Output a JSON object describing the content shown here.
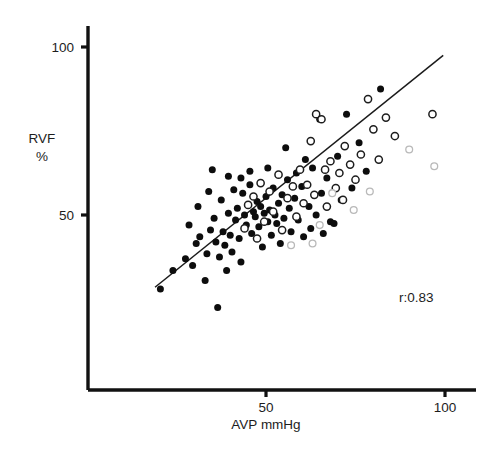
{
  "chart_data": {
    "type": "scatter",
    "title": "",
    "xlabel": "AVP mmHg",
    "ylabel_line1": "RVF",
    "ylabel_line2": "%",
    "xticks": [
      50,
      100
    ],
    "xticklabels": [
      "50",
      "100"
    ],
    "yticks": [
      50,
      100
    ],
    "yticklabels": [
      "50",
      "100"
    ],
    "xlim": [
      0,
      115
    ],
    "ylim": [
      0,
      113
    ],
    "grid": false,
    "legend": "none",
    "annotations": [
      {
        "text": "r:0.83",
        "x": 92,
        "y": 24
      }
    ],
    "trendline": {
      "label": "regression line",
      "x_start": 19,
      "y_start": 28.5,
      "x_end": 99.5,
      "y_end": 97.5
    },
    "series": [
      {
        "name": "filled circles",
        "marker": "filled-circle",
        "points": [
          [
            20.5,
            28.0
          ],
          [
            24.0,
            33.5
          ],
          [
            27.5,
            37.0
          ],
          [
            29.5,
            35.0
          ],
          [
            30.5,
            41.5
          ],
          [
            31.5,
            43.5
          ],
          [
            33.0,
            30.5
          ],
          [
            33.5,
            38.5
          ],
          [
            34.5,
            45.5
          ],
          [
            35.0,
            63.5
          ],
          [
            35.5,
            49.0
          ],
          [
            36.0,
            42.0
          ],
          [
            36.5,
            22.5
          ],
          [
            37.0,
            37.5
          ],
          [
            37.5,
            54.5
          ],
          [
            38.0,
            45.0
          ],
          [
            38.5,
            41.0
          ],
          [
            39.0,
            33.5
          ],
          [
            39.5,
            50.5
          ],
          [
            40.0,
            44.0
          ],
          [
            40.5,
            39.0
          ],
          [
            41.0,
            57.5
          ],
          [
            41.5,
            48.5
          ],
          [
            42.0,
            52.0
          ],
          [
            42.5,
            43.0
          ],
          [
            43.0,
            36.0
          ],
          [
            43.5,
            56.5
          ],
          [
            44.0,
            50.0
          ],
          [
            44.5,
            47.0
          ],
          [
            45.0,
            53.0
          ],
          [
            45.5,
            59.0
          ],
          [
            46.0,
            44.5
          ],
          [
            46.5,
            51.0
          ],
          [
            47.0,
            49.5
          ],
          [
            47.5,
            54.0
          ],
          [
            48.0,
            46.5
          ],
          [
            48.5,
            52.5
          ],
          [
            49.0,
            40.5
          ],
          [
            49.5,
            50.5
          ],
          [
            50.0,
            55.5
          ],
          [
            50.5,
            48.0
          ],
          [
            51.0,
            51.5
          ],
          [
            51.5,
            44.0
          ],
          [
            52.0,
            58.0
          ],
          [
            52.5,
            50.0
          ],
          [
            53.0,
            47.5
          ],
          [
            53.5,
            53.5
          ],
          [
            54.0,
            41.5
          ],
          [
            54.5,
            56.0
          ],
          [
            55.0,
            49.0
          ],
          [
            56.0,
            60.5
          ],
          [
            56.5,
            52.0
          ],
          [
            57.0,
            45.0
          ],
          [
            58.0,
            55.0
          ],
          [
            58.5,
            62.5
          ],
          [
            59.0,
            48.5
          ],
          [
            60.0,
            58.5
          ],
          [
            60.5,
            43.5
          ],
          [
            61.0,
            66.5
          ],
          [
            62.0,
            52.5
          ],
          [
            62.5,
            46.0
          ],
          [
            63.0,
            64.0
          ],
          [
            64.0,
            50.0
          ],
          [
            65.0,
            78.5
          ],
          [
            65.5,
            56.5
          ],
          [
            66.0,
            44.5
          ],
          [
            67.0,
            61.0
          ],
          [
            68.0,
            48.0
          ],
          [
            69.0,
            47.5
          ],
          [
            70.0,
            67.5
          ],
          [
            71.0,
            54.5
          ],
          [
            72.5,
            80.0
          ],
          [
            74.0,
            58.0
          ],
          [
            76.0,
            71.5
          ],
          [
            78.0,
            63.0
          ],
          [
            82.0,
            87.5
          ],
          [
            28.5,
            47.0
          ],
          [
            31.0,
            52.5
          ],
          [
            34.0,
            57.0
          ],
          [
            39.5,
            61.5
          ],
          [
            43.0,
            61.0
          ],
          [
            45.5,
            63.0
          ],
          [
            50.5,
            64.0
          ],
          [
            55.5,
            70.0
          ]
        ]
      },
      {
        "name": "open circles",
        "marker": "open-circle",
        "points": [
          [
            44.0,
            46.0
          ],
          [
            45.0,
            53.0
          ],
          [
            46.5,
            55.5
          ],
          [
            47.5,
            43.0
          ],
          [
            48.5,
            59.5
          ],
          [
            49.5,
            48.0
          ],
          [
            51.0,
            57.0
          ],
          [
            52.0,
            51.0
          ],
          [
            53.5,
            62.0
          ],
          [
            54.5,
            45.5
          ],
          [
            56.0,
            55.0
          ],
          [
            57.5,
            58.5
          ],
          [
            58.5,
            49.5
          ],
          [
            59.5,
            63.5
          ],
          [
            60.5,
            53.5
          ],
          [
            61.5,
            59.0
          ],
          [
            62.5,
            72.0
          ],
          [
            63.5,
            56.0
          ],
          [
            64.0,
            80.0
          ],
          [
            65.5,
            78.5
          ],
          [
            66.5,
            63.5
          ],
          [
            67.0,
            52.5
          ],
          [
            68.0,
            66.0
          ],
          [
            69.5,
            58.0
          ],
          [
            70.5,
            62.5
          ],
          [
            71.5,
            54.5
          ],
          [
            72.0,
            70.5
          ],
          [
            73.5,
            65.0
          ],
          [
            75.0,
            60.5
          ],
          [
            76.5,
            68.0
          ],
          [
            78.5,
            84.5
          ],
          [
            80.0,
            75.5
          ],
          [
            81.5,
            66.5
          ],
          [
            83.5,
            79.0
          ],
          [
            86.0,
            73.5
          ],
          [
            96.5,
            80.0
          ]
        ]
      },
      {
        "name": "faint open circles",
        "marker": "faint-open-circle",
        "points": [
          [
            65.0,
            47.0
          ],
          [
            68.5,
            56.5
          ],
          [
            74.5,
            51.5
          ],
          [
            79.0,
            57.0
          ],
          [
            90.0,
            69.5
          ],
          [
            97.0,
            64.5
          ],
          [
            57.0,
            41.0
          ],
          [
            63.0,
            41.5
          ]
        ]
      }
    ]
  }
}
